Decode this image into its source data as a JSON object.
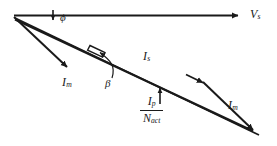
{
  "figure": {
    "type": "phasor-diagram",
    "background_color": "#ffffff",
    "stroke_color": "#1a1a1a"
  },
  "labels": {
    "supply_voltage": {
      "symbol": "V",
      "subscript": "s"
    },
    "phase_angle": {
      "symbol": "ϕ"
    },
    "magnetizing_current_left": {
      "symbol": "I",
      "subscript": "m"
    },
    "magnetizing_current_right": {
      "symbol": "I",
      "subscript": "m"
    },
    "secondary_current": {
      "symbol": "I",
      "subscript": "s"
    },
    "beta_angle": {
      "symbol": "β"
    },
    "primary_current_ratio": {
      "numerator_symbol": "I",
      "numerator_subscript": "p",
      "denominator_symbol": "N",
      "denominator_subscript": "act"
    }
  },
  "geometry": {
    "origin": [
      14,
      16
    ],
    "vs_tip": [
      245,
      15
    ],
    "im_left_tip": [
      73,
      73
    ],
    "bottom_right_vertex": [
      259,
      136
    ],
    "is_arrow_mid": [
      206,
      84
    ],
    "beta_marker": [
      97,
      50
    ],
    "phi_arrow": [
      53,
      11,
      53,
      23
    ],
    "ip_arrow": [
      160,
      105,
      160,
      88
    ]
  }
}
